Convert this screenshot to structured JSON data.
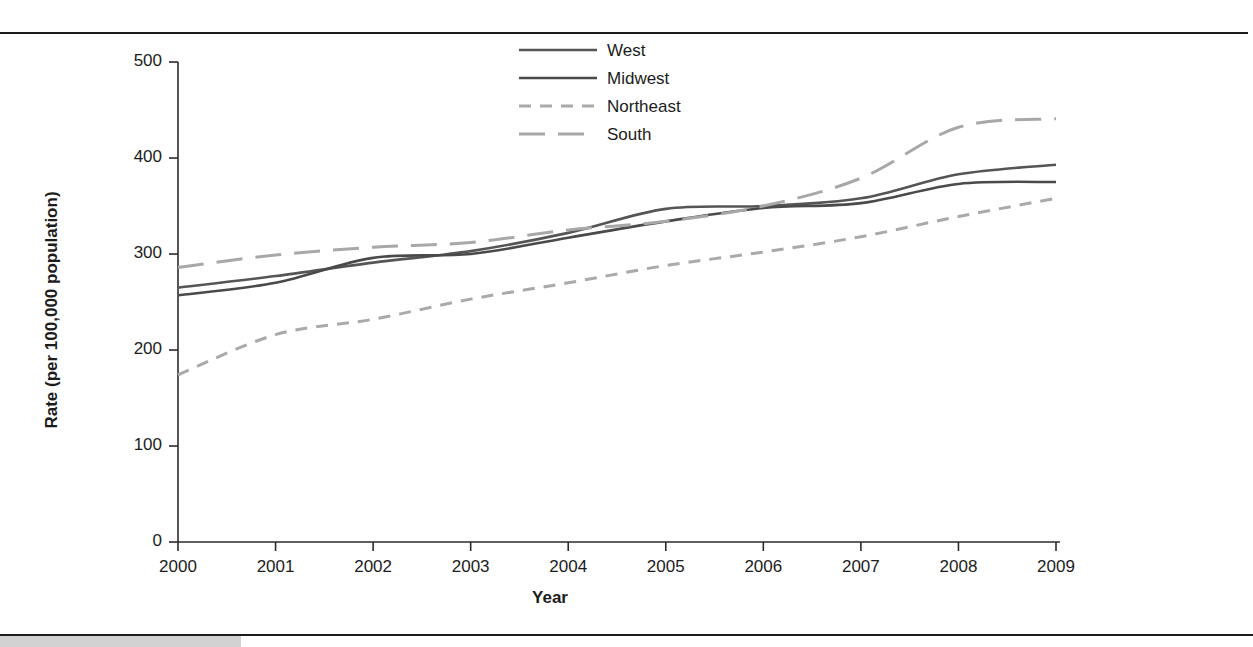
{
  "figure": {
    "background_color": "#ffffff",
    "rule_color": "#1c1c1c",
    "gray_block_color": "#d2d2d2"
  },
  "chart_data": {
    "type": "line",
    "title": "",
    "xlabel": "Year",
    "ylabel": "Rate (per 100,000 population)",
    "x": [
      2000,
      2001,
      2002,
      2003,
      2004,
      2005,
      2006,
      2007,
      2008,
      2009
    ],
    "xtick_labels": [
      "2000",
      "2001",
      "2002",
      "2003",
      "2004",
      "2005",
      "2006",
      "2007",
      "2008",
      "2009"
    ],
    "ytick_labels": [
      "0",
      "100",
      "200",
      "300",
      "400",
      "500"
    ],
    "yticks": [
      0,
      100,
      200,
      300,
      400,
      500
    ],
    "ylim": [
      0,
      500
    ],
    "xlim": [
      2000,
      2009
    ],
    "grid": false,
    "legend_position": "top-center",
    "series": [
      {
        "name": "West",
        "style": "solid",
        "color": "#555555",
        "values": [
          265,
          277,
          291,
          303,
          322,
          347,
          350,
          358,
          383,
          393
        ]
      },
      {
        "name": "Midwest",
        "style": "solid",
        "color": "#4a4a4a",
        "values": [
          257,
          270,
          296,
          300,
          317,
          334,
          348,
          353,
          373,
          375
        ]
      },
      {
        "name": "Northeast",
        "style": "dashed-short",
        "color": "#aaaaaa",
        "values": [
          174,
          216,
          232,
          253,
          270,
          288,
          302,
          318,
          339,
          358
        ]
      },
      {
        "name": "South",
        "style": "dashed-long",
        "color": "#a8a8a8",
        "values": [
          286,
          299,
          307,
          312,
          325,
          334,
          350,
          379,
          432,
          441
        ]
      }
    ]
  },
  "legend": {
    "entries": [
      {
        "label": "West"
      },
      {
        "label": "Midwest"
      },
      {
        "label": "Northeast"
      },
      {
        "label": "South"
      }
    ]
  }
}
